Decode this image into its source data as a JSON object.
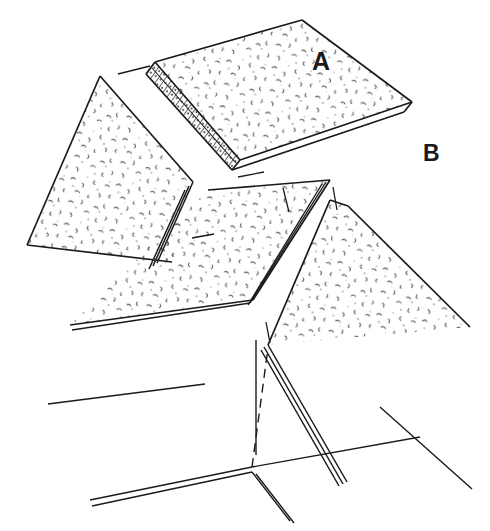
{
  "figure": {
    "background_color": "#ffffff",
    "line_color": "#1a1a1a",
    "texture_color": "#3c3c3c",
    "width": 490,
    "height": 531
  },
  "labels": [
    {
      "id": "A",
      "text": "A",
      "x": 312,
      "y": 49,
      "description": "callout label pointing at upper-right slab"
    },
    {
      "id": "B",
      "text": "B",
      "x": 423,
      "y": 142,
      "description": "callout label pointing at region right of slabs"
    }
  ],
  "parts": {
    "slab_a": {
      "name": "upper-right slab",
      "surface_texture": "stipple-aggregate",
      "edge_texture": "hatched-cut-edge",
      "top_face": "M155,62 L302,20 L412,102 L240,160 Z",
      "edge_band_outer": "M155,62 L146,74 L232,170 L240,160 Z",
      "edge_band_inner": "M152,66 L150,72 L234,166 L238,160 Z",
      "front_thin_face": "M232,170 L240,160 L412,102 L404,112 Z",
      "trailing_line_upper": "M404,112 L398,114",
      "thickness_lines": [
        "M240,160 L232,170",
        "M412,102 L404,112"
      ]
    },
    "slab_left": {
      "name": "left wedge slab",
      "surface_texture": "stipple-aggregate",
      "top_face": "M100,76 L193,182 L172,262 L27,245 Z",
      "riser_outer": "M172,262 L160,258 L149,252",
      "riser_lines": [
        "M193,182 L155,260",
        "M190,186 L152,262",
        "M186,190 L148,264"
      ]
    },
    "slab_middle": {
      "name": "centre slab",
      "surface_texture": "stipple-aggregate",
      "top_face": "M208,190 L330,180 L253,300 L70,325 Z",
      "bottom_edge_double": [
        "M70,325 L248,300",
        "M72,330 L250,305"
      ],
      "right_edge_double": [
        "M330,180 L253,300",
        "M326,181 L250,302"
      ]
    },
    "slab_right": {
      "name": "right slab",
      "surface_texture": "stipple-aggregate",
      "top_face": "M330,200 L348,206 L470,327 L268,345 Z",
      "left_edge_double": [
        "M268,345 L345,480",
        "M263,347 L340,482"
      ]
    },
    "ground_lines": {
      "long_left_edge": "M48,404 L205,384",
      "bottom_double": [
        "M90,500 L252,467",
        "M92,506 L252,472"
      ],
      "right_horizon": "M252,467 L420,437",
      "right_diagonal": "M380,407 L472,489",
      "vertical_tick": "M256,340 L256,455",
      "dashed_guide": "M252,467 L268,348",
      "corner_spur": [
        "M252,472 L288,520",
        "M256,474 L292,522"
      ],
      "short_ticks": [
        "M118,72 L148,66",
        "M238,176 L262,172",
        "M280,188 L288,210",
        "M192,236 L214,232",
        "M330,186 L336,208"
      ]
    }
  }
}
